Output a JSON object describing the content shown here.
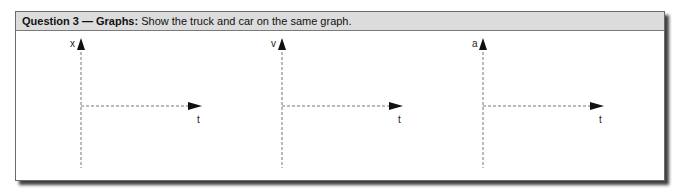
{
  "question": {
    "label": "Question 3 — Graphs:",
    "text": " Show the truck and car on the same graph."
  },
  "graphs": [
    {
      "y_label": "x",
      "x_label": "t"
    },
    {
      "y_label": "v",
      "x_label": "t"
    },
    {
      "y_label": "a",
      "x_label": "t"
    }
  ]
}
